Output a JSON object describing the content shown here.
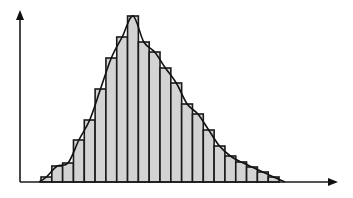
{
  "chart_data": {
    "type": "bar",
    "subtype": "histogram_with_density_curve",
    "title": "",
    "xlabel": "",
    "ylabel": "",
    "grid": false,
    "legend": null,
    "tick_labels": false,
    "bin_count": 22,
    "categories": [
      "1",
      "2",
      "3",
      "4",
      "5",
      "6",
      "7",
      "8",
      "9",
      "10",
      "11",
      "12",
      "13",
      "14",
      "15",
      "16",
      "17",
      "18",
      "19",
      "20",
      "21",
      "22"
    ],
    "values": [
      5,
      16,
      19,
      42,
      62,
      93,
      124,
      145,
      166,
      140,
      130,
      114,
      99,
      78,
      68,
      52,
      36,
      26,
      20,
      15,
      10,
      5
    ],
    "value_units": "relative height (px, peak = 166)",
    "ylim": [
      0,
      172
    ],
    "overlay_curve": "smooth right-skewed density curve passing through bar tops",
    "colors": {
      "bar_fill": "#d3d3d3",
      "bar_stroke": "#1a1a1a",
      "axis": "#1a1a1a",
      "curve": "#111111",
      "background": "#ffffff"
    }
  },
  "layout": {
    "origin_x": 20,
    "baseline_y": 182,
    "first_bar_x": 41,
    "bar_width": 10.82,
    "y_axis_top": 10,
    "x_axis_end": 338
  }
}
